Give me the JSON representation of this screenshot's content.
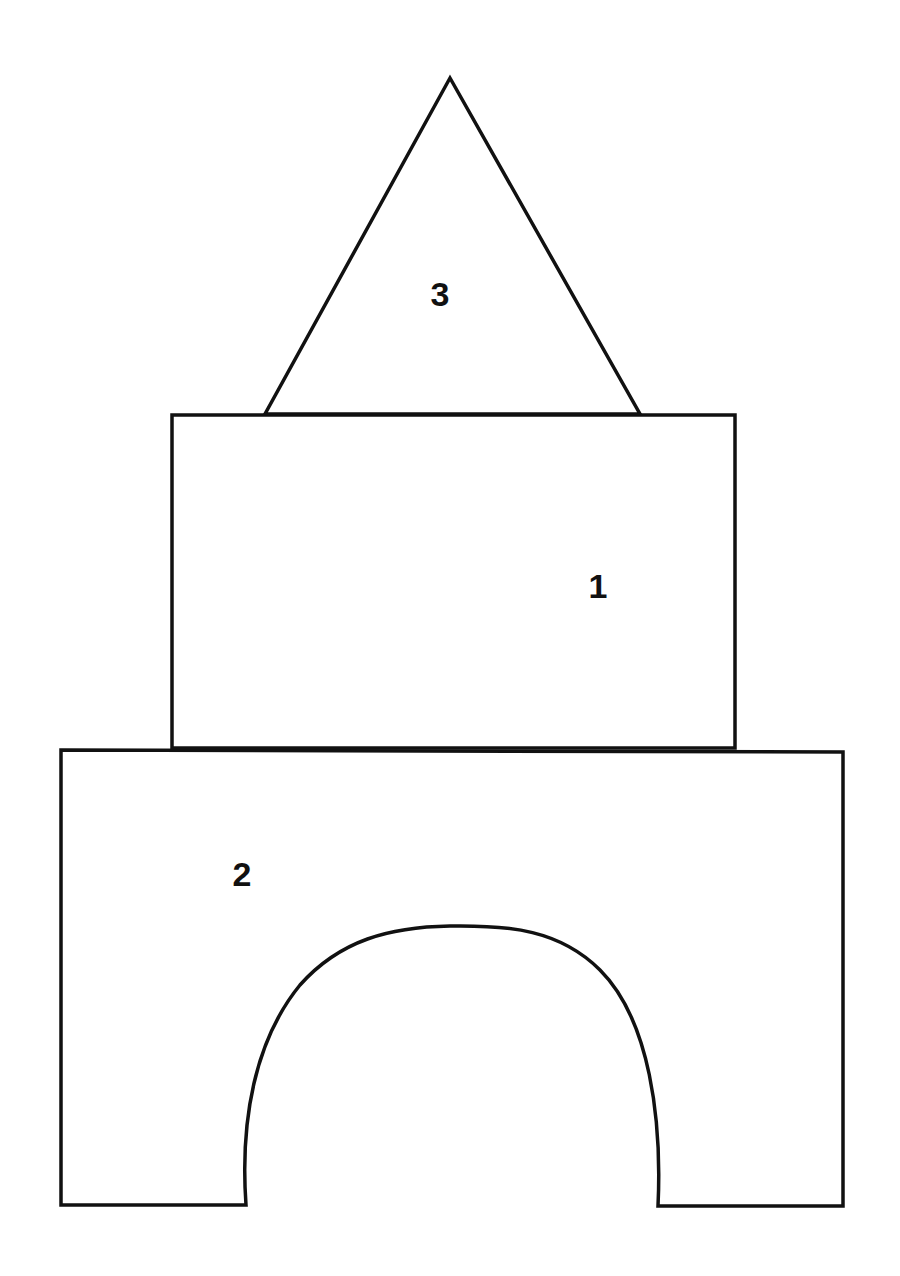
{
  "diagram": {
    "shapes": [
      {
        "id": "shape-1",
        "type": "rectangle",
        "label": "1"
      },
      {
        "id": "shape-2",
        "type": "arch-block",
        "label": "2"
      },
      {
        "id": "shape-3",
        "type": "triangle",
        "label": "3"
      }
    ],
    "colors": {
      "stroke": "#111111",
      "fill": "#ffffff",
      "background": "#ffffff"
    }
  }
}
